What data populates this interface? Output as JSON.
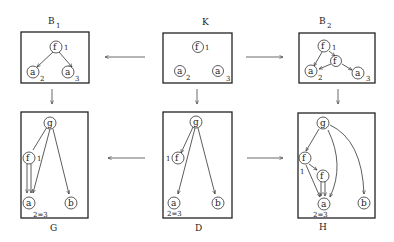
{
  "panels": {
    "B1": {
      "title": "B",
      "subscript": "1",
      "nodes": {
        "f": "f",
        "a2": "a",
        "a3": "a"
      },
      "labels": {
        "f": "1",
        "a2": "2",
        "a3": "3"
      }
    },
    "K": {
      "title": "K",
      "nodes": {
        "f": "f",
        "a2": "a",
        "a3": "a"
      },
      "labels": {
        "f": "1",
        "a2": "2",
        "a3": "3"
      }
    },
    "B2": {
      "title": "B",
      "subscript": "2",
      "nodes": {
        "f1": "f",
        "f2": "f",
        "a2": "a",
        "a3": "a"
      },
      "labels": {
        "f1": "1",
        "a2": "2",
        "a3": "3"
      }
    },
    "G": {
      "title": "G",
      "nodes": {
        "g": "g",
        "f": "f",
        "a": "a",
        "b": "b"
      },
      "labels": {
        "f": "1",
        "eq": "2=3"
      }
    },
    "D": {
      "title": "D",
      "nodes": {
        "g": "g",
        "f": "f",
        "a": "a",
        "b": "b"
      },
      "labels": {
        "f": "1",
        "eq": "2=3"
      }
    },
    "H": {
      "title": "H",
      "nodes": {
        "g": "g",
        "f1": "f",
        "f2": "f",
        "a": "a",
        "b": "b"
      },
      "labels": {
        "f1": "1",
        "eq": "2=3"
      }
    }
  },
  "arrows": [
    {
      "from": "K",
      "to": "B1"
    },
    {
      "from": "K",
      "to": "B2"
    },
    {
      "from": "B1",
      "to": "G"
    },
    {
      "from": "K",
      "to": "D"
    },
    {
      "from": "B2",
      "to": "H"
    },
    {
      "from": "D",
      "to": "G"
    },
    {
      "from": "D",
      "to": "H"
    }
  ]
}
